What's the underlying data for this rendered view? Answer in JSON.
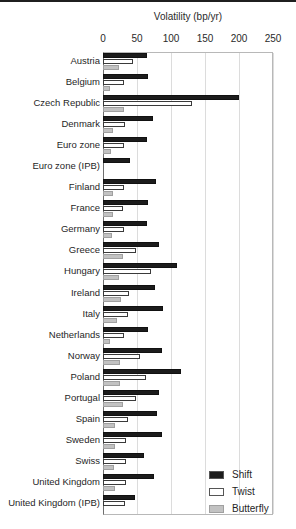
{
  "chart_data": {
    "type": "bar",
    "orientation": "horizontal",
    "title": "Volatility (bp/yr)",
    "xlabel": "Volatility (bp/yr)",
    "xlim": [
      0,
      250
    ],
    "xticks": [
      0,
      50,
      100,
      150,
      200,
      250
    ],
    "grid": "vertical gridlines at each 50 bp tick",
    "legend_position": "inside bottom-right",
    "categories": [
      "Austria",
      "Belgium",
      "Czech Republic",
      "Denmark",
      "Euro zone",
      "Euro zone (IPB)",
      "Finland",
      "France",
      "Germany",
      "Greece",
      "Hungary",
      "Ireland",
      "Italy",
      "Netherlands",
      "Norway",
      "Poland",
      "Portugal",
      "Spain",
      "Sweden",
      "Swiss",
      "United Kingdom",
      "United Kingdom (IPB)"
    ],
    "series": [
      {
        "name": "Shift",
        "color": "#1c1c1c",
        "values": [
          65,
          66,
          200,
          74,
          65,
          40,
          78,
          66,
          65,
          82,
          109,
          77,
          88,
          66,
          87,
          114,
          82,
          79,
          87,
          60,
          75,
          47
        ]
      },
      {
        "name": "Twist",
        "color": "#ffffff",
        "values": [
          44,
          31,
          131,
          32,
          31,
          0,
          31,
          30,
          31,
          49,
          71,
          38,
          37,
          31,
          54,
          63,
          49,
          37,
          34,
          34,
          34,
          32
        ]
      },
      {
        "name": "Butterfly",
        "color": "#c2c2c2",
        "values": [
          24,
          10,
          31,
          14,
          12,
          0,
          15,
          14,
          13,
          29,
          24,
          26,
          21,
          10,
          25,
          25,
          29,
          18,
          18,
          16,
          18,
          0
        ]
      }
    ]
  },
  "colors": {
    "top_rule": "#1f1f1f",
    "gridline": "#dcdcdc",
    "frame": "#b8b8b8",
    "axis_line": "#6e6e6e"
  }
}
